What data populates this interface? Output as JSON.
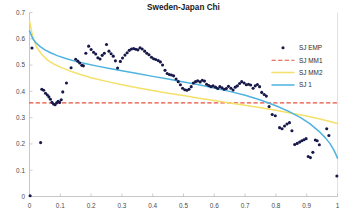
{
  "chart_data": {
    "type": "scatter",
    "title": "Sweden-Japan Chi",
    "xlabel": "",
    "ylabel": "",
    "xlim": [
      0,
      1
    ],
    "ylim": [
      0,
      0.7
    ],
    "grid": false,
    "legend_position": "upper-right",
    "xticks": [
      "0",
      "0.1",
      "0.2",
      "0.3",
      "0.4",
      "0.5",
      "0.6",
      "0.7",
      "0.8",
      "0.9",
      "1"
    ],
    "xtick_values": [
      0,
      0.1,
      0.2,
      0.3,
      0.4,
      0.5,
      0.6,
      0.7,
      0.8,
      0.9,
      1
    ],
    "yticks": [
      "0",
      "0.1",
      "0.2",
      "0.3",
      "0.4",
      "0.5",
      "0.6",
      "0.7"
    ],
    "ytick_values": [
      0,
      0.1,
      0.2,
      0.3,
      0.4,
      0.5,
      0.6,
      0.7
    ],
    "series": [
      {
        "name": "SJ EMP",
        "type": "scatter",
        "marker": "filled-circle",
        "color": "#16184a",
        "points": [
          [
            0.002,
            0.003
          ],
          [
            0.008,
            0.565
          ],
          [
            0.036,
            0.205
          ],
          [
            0.04,
            0.408
          ],
          [
            0.046,
            0.404
          ],
          [
            0.052,
            0.393
          ],
          [
            0.058,
            0.386
          ],
          [
            0.063,
            0.379
          ],
          [
            0.068,
            0.37
          ],
          [
            0.073,
            0.358
          ],
          [
            0.078,
            0.352
          ],
          [
            0.083,
            0.349
          ],
          [
            0.088,
            0.356
          ],
          [
            0.093,
            0.362
          ],
          [
            0.098,
            0.358
          ],
          [
            0.103,
            0.368
          ],
          [
            0.108,
            0.398
          ],
          [
            0.12,
            0.432
          ],
          [
            0.135,
            0.49
          ],
          [
            0.15,
            0.522
          ],
          [
            0.157,
            0.515
          ],
          [
            0.163,
            0.508
          ],
          [
            0.17,
            0.499
          ],
          [
            0.175,
            0.497
          ],
          [
            0.183,
            0.545
          ],
          [
            0.192,
            0.572
          ],
          [
            0.2,
            0.559
          ],
          [
            0.208,
            0.549
          ],
          [
            0.215,
            0.542
          ],
          [
            0.222,
            0.528
          ],
          [
            0.229,
            0.523
          ],
          [
            0.236,
            0.537
          ],
          [
            0.243,
            0.545
          ],
          [
            0.25,
            0.578
          ],
          [
            0.258,
            0.553
          ],
          [
            0.265,
            0.543
          ],
          [
            0.272,
            0.534
          ],
          [
            0.279,
            0.516
          ],
          [
            0.286,
            0.489
          ],
          [
            0.295,
            0.514
          ],
          [
            0.302,
            0.527
          ],
          [
            0.31,
            0.538
          ],
          [
            0.317,
            0.547
          ],
          [
            0.324,
            0.556
          ],
          [
            0.331,
            0.561
          ],
          [
            0.338,
            0.563
          ],
          [
            0.345,
            0.56
          ],
          [
            0.352,
            0.558
          ],
          [
            0.359,
            0.566
          ],
          [
            0.366,
            0.561
          ],
          [
            0.374,
            0.553
          ],
          [
            0.381,
            0.545
          ],
          [
            0.388,
            0.539
          ],
          [
            0.396,
            0.53
          ],
          [
            0.403,
            0.524
          ],
          [
            0.41,
            0.521
          ],
          [
            0.418,
            0.517
          ],
          [
            0.425,
            0.512
          ],
          [
            0.432,
            0.5
          ],
          [
            0.44,
            0.48
          ],
          [
            0.447,
            0.468
          ],
          [
            0.454,
            0.464
          ],
          [
            0.461,
            0.462
          ],
          [
            0.468,
            0.459
          ],
          [
            0.476,
            0.447
          ],
          [
            0.483,
            0.437
          ],
          [
            0.49,
            0.425
          ],
          [
            0.497,
            0.412
          ],
          [
            0.504,
            0.406
          ],
          [
            0.511,
            0.404
          ],
          [
            0.518,
            0.408
          ],
          [
            0.525,
            0.418
          ],
          [
            0.532,
            0.432
          ],
          [
            0.539,
            0.437
          ],
          [
            0.546,
            0.44
          ],
          [
            0.554,
            0.436
          ],
          [
            0.561,
            0.442
          ],
          [
            0.568,
            0.439
          ],
          [
            0.575,
            0.427
          ],
          [
            0.582,
            0.422
          ],
          [
            0.589,
            0.418
          ],
          [
            0.596,
            0.421
          ],
          [
            0.604,
            0.416
          ],
          [
            0.611,
            0.411
          ],
          [
            0.618,
            0.418
          ],
          [
            0.625,
            0.414
          ],
          [
            0.632,
            0.408
          ],
          [
            0.639,
            0.411
          ],
          [
            0.646,
            0.419
          ],
          [
            0.654,
            0.412
          ],
          [
            0.661,
            0.405
          ],
          [
            0.668,
            0.416
          ],
          [
            0.675,
            0.421
          ],
          [
            0.682,
            0.43
          ],
          [
            0.689,
            0.437
          ],
          [
            0.697,
            0.432
          ],
          [
            0.704,
            0.425
          ],
          [
            0.711,
            0.427
          ],
          [
            0.718,
            0.424
          ],
          [
            0.726,
            0.412
          ],
          [
            0.733,
            0.421
          ],
          [
            0.74,
            0.426
          ],
          [
            0.747,
            0.418
          ],
          [
            0.754,
            0.396
          ],
          [
            0.762,
            0.388
          ],
          [
            0.769,
            0.382
          ],
          [
            0.778,
            0.342
          ],
          [
            0.788,
            0.312
          ],
          [
            0.798,
            0.307
          ],
          [
            0.812,
            0.262
          ],
          [
            0.82,
            0.258
          ],
          [
            0.828,
            0.268
          ],
          [
            0.836,
            0.276
          ],
          [
            0.844,
            0.281
          ],
          [
            0.852,
            0.25
          ],
          [
            0.861,
            0.198
          ],
          [
            0.869,
            0.202
          ],
          [
            0.877,
            0.207
          ],
          [
            0.884,
            0.212
          ],
          [
            0.891,
            0.216
          ],
          [
            0.898,
            0.22
          ],
          [
            0.905,
            0.152
          ],
          [
            0.912,
            0.148
          ],
          [
            0.92,
            0.168
          ],
          [
            0.928,
            0.215
          ],
          [
            0.934,
            0.212
          ],
          [
            0.941,
            0.197
          ],
          [
            0.965,
            0.258
          ],
          [
            0.972,
            0.232
          ],
          [
            0.998,
            0.078
          ]
        ]
      },
      {
        "name": "SJ MM1",
        "type": "line",
        "style": "dashed",
        "color": "#e8503a",
        "constant_value": 0.356,
        "points": [
          [
            0.0,
            0.356
          ],
          [
            1.0,
            0.356
          ]
        ]
      },
      {
        "name": "SJ MM2",
        "type": "line",
        "style": "solid",
        "color": "#f5e06a",
        "points": [
          [
            0.0,
            0.668
          ],
          [
            0.012,
            0.6
          ],
          [
            0.025,
            0.565
          ],
          [
            0.04,
            0.54
          ],
          [
            0.06,
            0.518
          ],
          [
            0.08,
            0.503
          ],
          [
            0.1,
            0.492
          ],
          [
            0.13,
            0.478
          ],
          [
            0.16,
            0.466
          ],
          [
            0.2,
            0.452
          ],
          [
            0.25,
            0.438
          ],
          [
            0.3,
            0.425
          ],
          [
            0.35,
            0.414
          ],
          [
            0.4,
            0.403
          ],
          [
            0.45,
            0.393
          ],
          [
            0.5,
            0.384
          ],
          [
            0.55,
            0.374
          ],
          [
            0.6,
            0.365
          ],
          [
            0.65,
            0.356
          ],
          [
            0.7,
            0.347
          ],
          [
            0.75,
            0.338
          ],
          [
            0.8,
            0.328
          ],
          [
            0.85,
            0.317
          ],
          [
            0.9,
            0.306
          ],
          [
            0.95,
            0.293
          ],
          [
            1.0,
            0.278
          ]
        ]
      },
      {
        "name": "SJ 1",
        "type": "line",
        "style": "solid",
        "color": "#4eb3e0",
        "points": [
          [
            0.0,
            0.63
          ],
          [
            0.01,
            0.602
          ],
          [
            0.02,
            0.586
          ],
          [
            0.035,
            0.57
          ],
          [
            0.05,
            0.558
          ],
          [
            0.07,
            0.546
          ],
          [
            0.09,
            0.536
          ],
          [
            0.12,
            0.524
          ],
          [
            0.15,
            0.514
          ],
          [
            0.18,
            0.506
          ],
          [
            0.22,
            0.496
          ],
          [
            0.26,
            0.487
          ],
          [
            0.3,
            0.478
          ],
          [
            0.35,
            0.468
          ],
          [
            0.4,
            0.457
          ],
          [
            0.45,
            0.447
          ],
          [
            0.5,
            0.436
          ],
          [
            0.55,
            0.425
          ],
          [
            0.6,
            0.413
          ],
          [
            0.65,
            0.4
          ],
          [
            0.7,
            0.385
          ],
          [
            0.75,
            0.367
          ],
          [
            0.8,
            0.345
          ],
          [
            0.84,
            0.325
          ],
          [
            0.88,
            0.3
          ],
          [
            0.91,
            0.277
          ],
          [
            0.94,
            0.248
          ],
          [
            0.96,
            0.224
          ],
          [
            0.975,
            0.202
          ],
          [
            0.985,
            0.183
          ],
          [
            0.993,
            0.165
          ],
          [
            1.0,
            0.146
          ]
        ]
      }
    ],
    "legend_entries": [
      {
        "label": "SJ EMP",
        "marker": "dot",
        "color": "#16184a"
      },
      {
        "label": "SJ MM1",
        "marker": "dashed-line",
        "color": "#e8503a"
      },
      {
        "label": "SJ MM2",
        "marker": "solid-line",
        "color": "#f5e06a"
      },
      {
        "label": "SJ 1",
        "marker": "solid-line",
        "color": "#4eb3e0"
      }
    ]
  }
}
